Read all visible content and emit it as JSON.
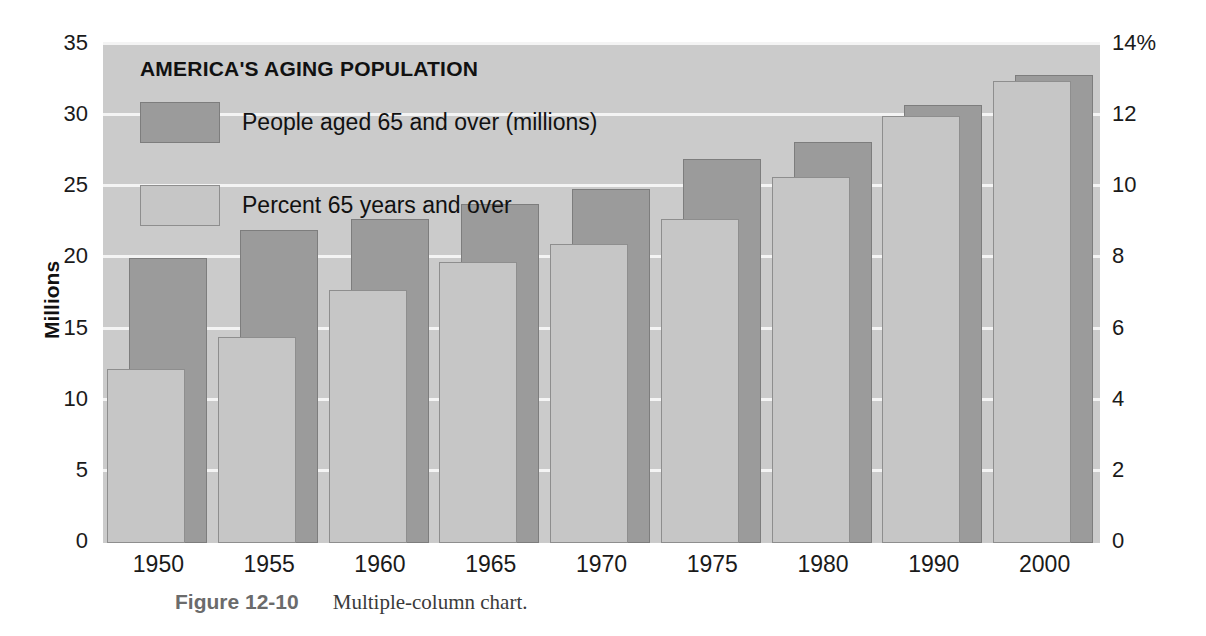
{
  "chart_data": {
    "type": "bar",
    "title": "AMERICA'S AGING POPULATION",
    "categories": [
      "1950",
      "1955",
      "1960",
      "1965",
      "1970",
      "1975",
      "1980",
      "1990",
      "2000"
    ],
    "series": [
      {
        "name": "People aged 65 and over (millions)",
        "axis": "left",
        "color": "#9b9b9b",
        "values": [
          20.0,
          22.0,
          22.8,
          23.8,
          24.9,
          27.0,
          28.2,
          30.8,
          32.9
        ]
      },
      {
        "name": "Percent 65 years and over",
        "axis": "right",
        "color": "#c6c6c6",
        "values": [
          4.9,
          5.8,
          7.1,
          7.9,
          8.4,
          9.1,
          10.3,
          12.0,
          13.0
        ]
      }
    ],
    "xlabel": "",
    "ylabel": "Millions",
    "ylim": [
      0,
      35
    ],
    "y_ticks": [
      "0",
      "5",
      "10",
      "15",
      "20",
      "25",
      "30",
      "35"
    ],
    "y2label": "",
    "y2lim": [
      0,
      14
    ],
    "y2_ticks": [
      "0",
      "2",
      "4",
      "6",
      "8",
      "10",
      "12",
      "14%"
    ],
    "grid": true,
    "legend_position": "top-left",
    "background": "#cbcbcb",
    "gridline_color": "#f4f4f4"
  },
  "legend": {
    "items": [
      {
        "label": "People aged 65 and over (millions)",
        "swatch": "dark"
      },
      {
        "label": "Percent 65 years and over",
        "swatch": "light"
      }
    ]
  },
  "caption": {
    "label": "Figure 12-10",
    "text": "Multiple-column chart."
  }
}
